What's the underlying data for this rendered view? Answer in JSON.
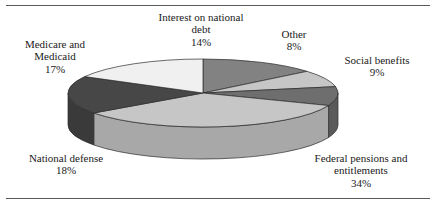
{
  "figure": {
    "title": "",
    "top_rule_color": "#5a5a5a",
    "bottom_rule_color": "#5a5a5a",
    "background": "#ffffff"
  },
  "chart_data": {
    "type": "pie",
    "title": "",
    "subtitle": "",
    "xlabel": "",
    "ylabel": "",
    "units": "percent",
    "total": 100,
    "legend_position": "none",
    "labels_position": "outside-callout",
    "three_d": true,
    "grid": false,
    "categories": [
      "Interest on national debt",
      "Other",
      "Social benefits",
      "Federal pensions and entitlements",
      "National defense",
      "Medicare and Medicaid"
    ],
    "values": [
      14,
      8,
      9,
      34,
      18,
      17
    ],
    "slices": [
      {
        "label": "Interest on national debt",
        "label_line1": "Interest on national",
        "label_line2": "debt",
        "value": 14,
        "percent_text": "14%",
        "color": "#828282",
        "side_color": "#6b6b6b"
      },
      {
        "label": "Other",
        "label_line1": "Other",
        "label_line2": "",
        "value": 8,
        "percent_text": "8%",
        "color": "#c6c6c6",
        "side_color": "#a8a8a8"
      },
      {
        "label": "Social benefits",
        "label_line1": "Social benefits",
        "label_line2": "",
        "value": 9,
        "percent_text": "9%",
        "color": "#6e6e6e",
        "side_color": "#5a5a5a"
      },
      {
        "label": "Federal pensions and entitlements",
        "label_line1": "Federal pensions and",
        "label_line2": "entitlements",
        "value": 34,
        "percent_text": "34%",
        "color": "#c6c6c6",
        "side_color": "#a8a8a8"
      },
      {
        "label": "National defense",
        "label_line1": "National defense",
        "label_line2": "",
        "value": 18,
        "percent_text": "18%",
        "color": "#474747",
        "side_color": "#3a3a3a"
      },
      {
        "label": "Medicare and Medicaid",
        "label_line1": "Medicare and",
        "label_line2": "Medicaid",
        "value": 17,
        "percent_text": "17%",
        "color": "#f0f0f0",
        "side_color": "#d2d2d2"
      }
    ]
  }
}
